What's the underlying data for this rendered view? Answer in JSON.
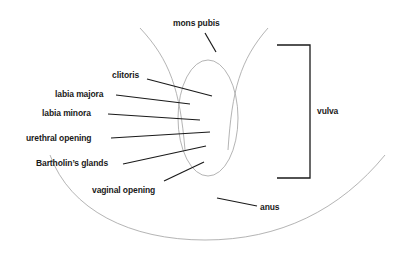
{
  "diagram": {
    "colors": {
      "ink": "#1a1a1a",
      "background": "#ffffff"
    },
    "labels": {
      "mons_pubis": "mons pubis",
      "clitoris": "clitoris",
      "labia_majora": "labia majora",
      "labia_minora": "labia minora",
      "urethral_opening": "urethral opening",
      "bartholins_glands": "Bartholin’s glands",
      "vaginal_opening": "vaginal opening",
      "anus": "anus",
      "vulva": "vulva"
    }
  }
}
